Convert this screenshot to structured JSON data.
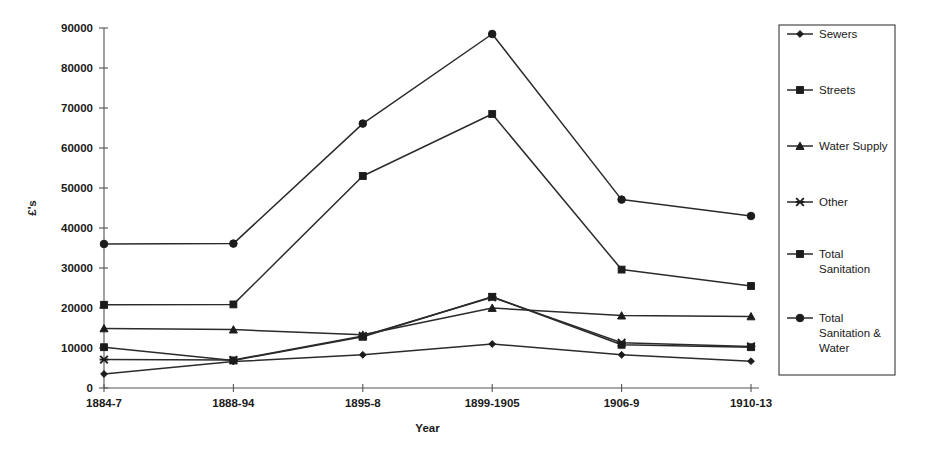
{
  "chart_data": {
    "type": "line",
    "title": "",
    "xlabel": "Year",
    "ylabel": "£'s",
    "categories": [
      "1884-7",
      "1888-94",
      "1895-8",
      "1899-1905",
      "1906-9",
      "1910-13"
    ],
    "ylim": [
      0,
      90000
    ],
    "ytick_labels": [
      "0",
      "10000",
      "20000",
      "30000",
      "40000",
      "50000",
      "60000",
      "70000",
      "80000",
      "90000"
    ],
    "ytick_values": [
      0,
      10000,
      20000,
      30000,
      40000,
      50000,
      60000,
      70000,
      80000,
      90000
    ],
    "grid": false,
    "legend_position": "right",
    "series": [
      {
        "name": "Sewers",
        "marker": "diamond",
        "values": [
          3500,
          6600,
          8300,
          11000,
          8300,
          6700
        ]
      },
      {
        "name": "Streets",
        "marker": "square",
        "values": [
          10200,
          6900,
          12800,
          22800,
          10800,
          10200
        ]
      },
      {
        "name": "Water Supply",
        "marker": "triangle",
        "values": [
          14900,
          14600,
          13300,
          20000,
          18100,
          17900
        ]
      },
      {
        "name": "Other",
        "marker": "asterisk",
        "values": [
          7100,
          7000,
          13000,
          22700,
          11300,
          10400
        ]
      },
      {
        "name": "Total Sanitation",
        "marker": "square",
        "values": [
          20800,
          20900,
          53000,
          68500,
          29600,
          25500
        ]
      },
      {
        "name": "Total Sanitation & Water",
        "marker": "circle",
        "values": [
          36000,
          36100,
          66100,
          88500,
          47100,
          43000
        ]
      }
    ]
  },
  "legend": {
    "entries": [
      {
        "label": "Sewers",
        "marker": "diamond"
      },
      {
        "label": "Streets",
        "marker": "square"
      },
      {
        "label": "Water Supply",
        "marker": "triangle"
      },
      {
        "label": "Other",
        "marker": "asterisk"
      },
      {
        "label": "Total Sanitation",
        "marker": "square",
        "lines": [
          "Total",
          "Sanitation"
        ]
      },
      {
        "label": "Total Sanitation & Water",
        "marker": "circle",
        "lines": [
          "Total",
          "Sanitation &",
          "Water"
        ]
      }
    ]
  },
  "axes": {
    "y_title": "£'s",
    "x_title": "Year"
  }
}
